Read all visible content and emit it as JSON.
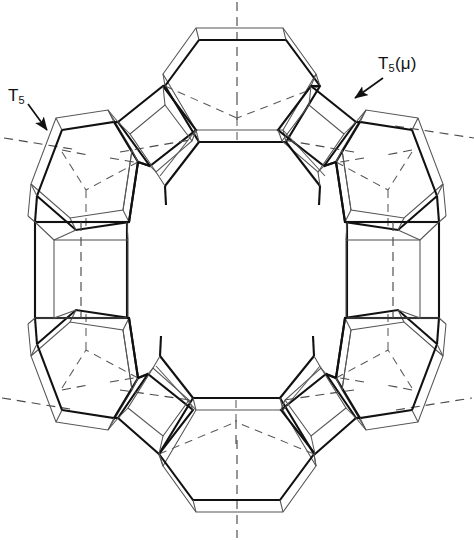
{
  "figure": {
    "type": "polyhedral-framework-diagram",
    "width": 474,
    "height": 540,
    "center": [
      237,
      272
    ],
    "background_color": "#ffffff",
    "line_color": "#111111",
    "dash_color": "#444444",
    "thin_line_color": "#555555",
    "symmetry": "8-fold ring, 4 hexagonal units and 4 square units alternating"
  },
  "labels": [
    {
      "id": "t5",
      "text": "T",
      "subscript": "5",
      "full_text": "T5",
      "x": 8,
      "y": 86,
      "arrow": {
        "from": [
          30,
          106
        ],
        "to": [
          46,
          128
        ]
      }
    },
    {
      "id": "t5mu",
      "text": "T",
      "subscript": "5",
      "suffix": "(μ)",
      "full_text": "T5(μ)",
      "x": 378,
      "y": 54,
      "arrow": {
        "from": [
          382,
          76
        ],
        "to": [
          356,
          96
        ]
      }
    }
  ],
  "units": [
    {
      "id": "hex-top",
      "shape": "hexagon",
      "angle_deg": 270,
      "position": "top"
    },
    {
      "id": "hex-bottom",
      "shape": "hexagon",
      "angle_deg": 90,
      "position": "bottom"
    },
    {
      "id": "hex-upper-left",
      "shape": "hexagon",
      "angle_deg": 202.5,
      "position": "upper-left"
    },
    {
      "id": "hex-upper-right",
      "shape": "hexagon",
      "angle_deg": 337.5,
      "position": "upper-right"
    },
    {
      "id": "hex-lower-left",
      "shape": "hexagon",
      "angle_deg": 157.5,
      "position": "lower-left"
    },
    {
      "id": "hex-lower-right",
      "shape": "hexagon",
      "angle_deg": 22.5,
      "position": "lower-right"
    },
    {
      "id": "sq-left",
      "shape": "square",
      "angle_deg": 180,
      "position": "left"
    },
    {
      "id": "sq-right",
      "shape": "square",
      "angle_deg": 0,
      "position": "right"
    },
    {
      "id": "sq-upper-left",
      "shape": "square",
      "angle_deg": 225,
      "position": "upper-left-link"
    },
    {
      "id": "sq-upper-right",
      "shape": "square",
      "angle_deg": 315,
      "position": "upper-right-link"
    },
    {
      "id": "sq-lower-left",
      "shape": "square",
      "angle_deg": 135,
      "position": "lower-left-link"
    },
    {
      "id": "sq-lower-right",
      "shape": "square",
      "angle_deg": 45,
      "position": "lower-right-link"
    }
  ],
  "axes": [
    {
      "id": "axis-vertical",
      "angle_deg": 90,
      "style": "dashed"
    },
    {
      "id": "axis-diag-ne",
      "angle_deg": 22,
      "style": "dashed"
    },
    {
      "id": "axis-diag-nw",
      "angle_deg": 158,
      "style": "dashed"
    }
  ]
}
